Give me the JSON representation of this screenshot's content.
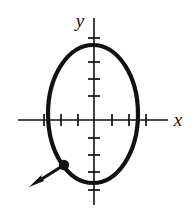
{
  "figure": {
    "kind": "coordinate-plane-diagram",
    "background_color": "#ffffff",
    "ink_color": "#111111"
  },
  "axes": {
    "x_axis": {
      "label": "x",
      "label_x": 178,
      "label_y": 125,
      "line_x1": 18,
      "line_x2": 168,
      "line_y": 120,
      "tick_half_length": 6,
      "tick_positions": [
        44,
        61,
        78,
        112,
        129,
        146
      ],
      "stroke_width": 1.6
    },
    "y_axis": {
      "label": "y",
      "label_x": 80,
      "label_y": 27,
      "line_x": 94,
      "line_y1": 18,
      "line_y2": 205,
      "tick_half_length": 6,
      "tick_positions": [
        38,
        62,
        79,
        96,
        138,
        155,
        172,
        190
      ],
      "stroke_width": 1.6
    },
    "origin": {
      "x": 94,
      "y": 120
    }
  },
  "ellipse": {
    "center_x": 93,
    "center_y": 114,
    "radius_x": 45,
    "radius_y": 69,
    "stroke_width": 4.2,
    "fill": "none"
  },
  "point": {
    "label": "",
    "x": 64,
    "y": 165,
    "radius": 5.2
  },
  "arrow": {
    "label": "",
    "from_x": 64,
    "from_y": 165,
    "to_x": 31,
    "to_y": 186,
    "stroke_width": 3.2,
    "head_length": 12,
    "head_width": 9
  }
}
